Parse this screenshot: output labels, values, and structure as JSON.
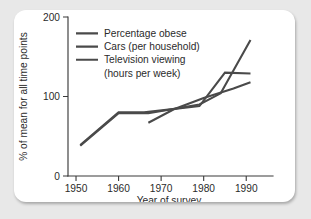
{
  "chart_data": {
    "type": "line",
    "title": "",
    "xlabel": "Year of survey",
    "ylabel": "% of mean for all time points",
    "xlim": [
      1946,
      1993
    ],
    "ylim": [
      0,
      200
    ],
    "xticks": [
      1950,
      1960,
      1970,
      1980,
      1990
    ],
    "xtick_labels": [
      "1950",
      "1960",
      "1970",
      "1980",
      "1990"
    ],
    "yticks": [
      0,
      100,
      200
    ],
    "ytick_labels": [
      "0",
      "100",
      "200"
    ],
    "grid": false,
    "legend_position": "upper-left-inside",
    "line_color": "#4a4a4a",
    "series": [
      {
        "name": "Percentage obese",
        "color": "#4a4a4a",
        "x": [
          1967,
          1973,
          1980,
          1987,
          1991
        ],
        "values": [
          67,
          84,
          98,
          110,
          118
        ]
      },
      {
        "name": "Cars (per household)",
        "color": "#4a4a4a",
        "x": [
          1951,
          1960,
          1966,
          1979,
          1985,
          1991
        ],
        "values": [
          39,
          80,
          80,
          88,
          130,
          129
        ]
      },
      {
        "name": "Television viewing (hours per week)",
        "color": "#4a4a4a",
        "x": [
          1951,
          1960,
          1967,
          1979,
          1984,
          1991
        ],
        "values": [
          38,
          79,
          79,
          90,
          104,
          171
        ]
      }
    ]
  },
  "legend": {
    "entries": [
      {
        "label": "Percentage obese"
      },
      {
        "label": "Cars (per household)"
      },
      {
        "label": "Television viewing"
      },
      {
        "label": "(hours per week)"
      }
    ]
  }
}
